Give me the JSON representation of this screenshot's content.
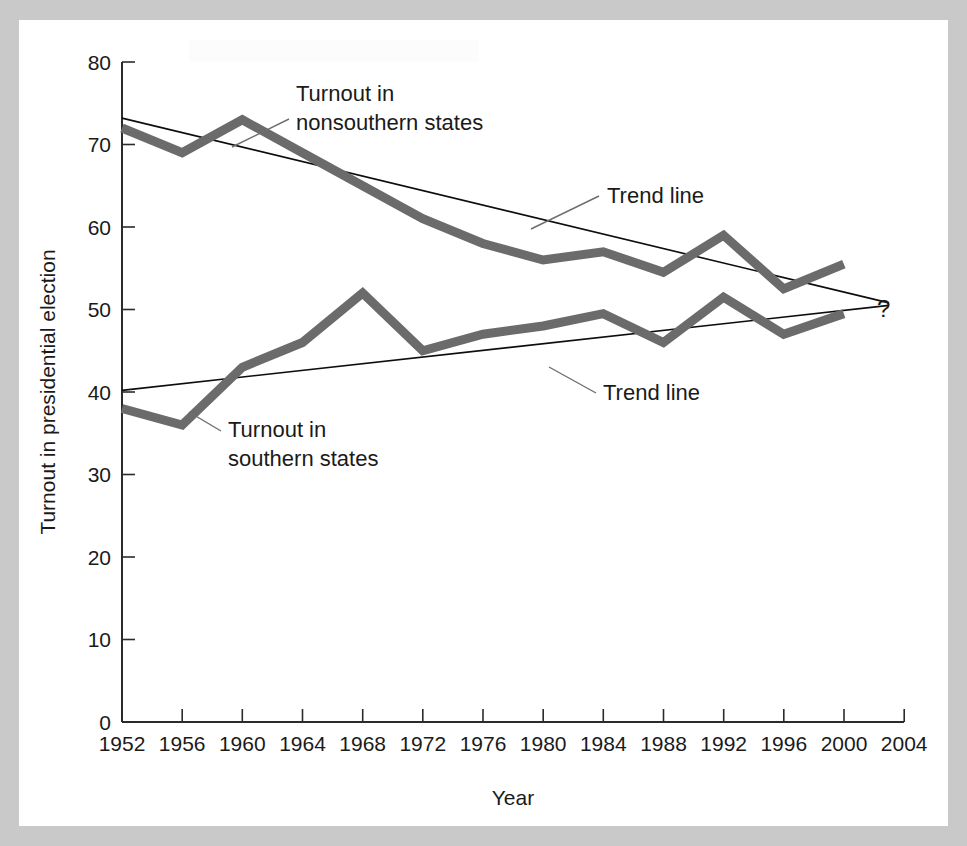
{
  "chart_data": {
    "type": "line",
    "title": "",
    "xlabel": "Year",
    "ylabel": "Turnout in presidential election",
    "xlim": [
      1952,
      2004
    ],
    "ylim": [
      0,
      80
    ],
    "grid": false,
    "legend_position": "inline-annotations",
    "x": [
      1952,
      1956,
      1960,
      1964,
      1968,
      1972,
      1976,
      1980,
      1984,
      1988,
      1992,
      1996,
      2000
    ],
    "xtick_labels": [
      "1952",
      "1956",
      "1960",
      "1964",
      "1968",
      "1972",
      "1976",
      "1980",
      "1984",
      "1988",
      "1992",
      "1996",
      "2000",
      "2004"
    ],
    "ytick_labels": [
      "0",
      "10",
      "20",
      "30",
      "40",
      "50",
      "60",
      "70",
      "80"
    ],
    "ytick_values": [
      0,
      10,
      20,
      30,
      40,
      50,
      60,
      70,
      80
    ],
    "series": [
      {
        "name": "Turnout in nonsouthern states",
        "color": "#6b6b6b",
        "values": [
          72,
          69,
          73,
          69,
          65,
          61,
          58,
          56,
          57,
          54.5,
          59,
          52.5,
          55.5
        ]
      },
      {
        "name": "Turnout in southern states",
        "color": "#6b6b6b",
        "values": [
          38,
          36,
          43,
          46,
          52,
          45,
          47,
          48,
          49.5,
          46,
          51.5,
          47,
          49.5
        ]
      }
    ],
    "trend_lines": [
      {
        "name": "Trend line (nonsouthern)",
        "color": "#0d0d0d",
        "x": [
          1952,
          2003
        ],
        "values": [
          73.2,
          50.8
        ]
      },
      {
        "name": "Trend line (southern)",
        "color": "#0d0d0d",
        "x": [
          1952,
          2003
        ],
        "values": [
          40.2,
          50.5
        ]
      }
    ],
    "annotations": [
      {
        "id": "nonsouthern-label",
        "text_line1": "Turnout in",
        "text_line2": "nonsouthern states"
      },
      {
        "id": "southern-label",
        "text_line1": "Turnout in",
        "text_line2": "southern states"
      },
      {
        "id": "trend-upper-label",
        "text": "Trend line"
      },
      {
        "id": "trend-lower-label",
        "text": "Trend line"
      },
      {
        "id": "future-unknown-marker",
        "text": "?"
      }
    ]
  },
  "axes": {
    "x_title": "Year",
    "y_title": "Turnout in presidential election",
    "x_ticks": [
      "1952",
      "1956",
      "1960",
      "1964",
      "1968",
      "1972",
      "1976",
      "1980",
      "1984",
      "1988",
      "1992",
      "1996",
      "2000",
      "2004"
    ],
    "y_ticks": [
      "80",
      "70",
      "60",
      "50",
      "40",
      "30",
      "20",
      "10",
      "0"
    ]
  },
  "labels": {
    "nonsouthern_l1": "Turnout in",
    "nonsouthern_l2": "nonsouthern states",
    "southern_l1": "Turnout in",
    "southern_l2": "southern states",
    "trend_upper": "Trend line",
    "trend_lower": "Trend line",
    "question_mark": "?"
  }
}
